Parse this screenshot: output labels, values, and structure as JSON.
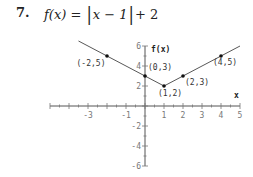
{
  "problem": {
    "number": "7.",
    "formula_prefix": "f(x) = ",
    "formula_abs_inner": "x − 1",
    "formula_suffix": "+ 2"
  },
  "chart_data": {
    "type": "line",
    "xlabel": "x",
    "ylabel": "f(x)",
    "xlim": [
      -5,
      5
    ],
    "ylim": [
      -6,
      6
    ],
    "x_ticks_labeled": [
      -3,
      -1,
      1,
      2,
      3,
      4,
      5
    ],
    "x_tick_labels": [
      "-3",
      "-1",
      "1",
      "2",
      "3",
      "4",
      "5"
    ],
    "y_ticks_labeled": [
      6,
      4,
      2,
      -2,
      -4,
      -6
    ],
    "y_tick_labels": [
      "6",
      "4",
      "2",
      "-2",
      "-4",
      "-6"
    ],
    "grid": false,
    "series": [
      {
        "name": "f(x) = |x − 1| + 2",
        "x": [
          -3.5,
          -2,
          0,
          1,
          2,
          4,
          5
        ],
        "y": [
          6.5,
          5,
          3,
          2,
          3,
          5,
          6
        ]
      }
    ],
    "annotated_points": [
      {
        "x": -2,
        "y": 5,
        "label": "(-2,5)"
      },
      {
        "x": 0,
        "y": 3,
        "label": "(0,3)"
      },
      {
        "x": 1,
        "y": 2,
        "label": "(1,2)"
      },
      {
        "x": 2,
        "y": 3,
        "label": "(2,3)"
      },
      {
        "x": 4,
        "y": 5,
        "label": "(4,5)"
      }
    ]
  }
}
